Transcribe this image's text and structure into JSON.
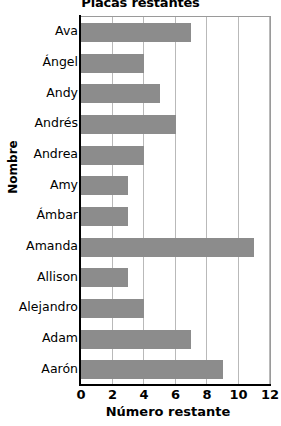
{
  "chart_data": {
    "type": "bar",
    "orientation": "horizontal",
    "title": "Placas restantes",
    "xlabel": "Número restante",
    "ylabel": "Nombre",
    "categories": [
      "Ava",
      "Ángel",
      "Andy",
      "Andrés",
      "Andrea",
      "Amy",
      "Ámbar",
      "Amanda",
      "Allison",
      "Alejandro",
      "Adam",
      "Aarón"
    ],
    "values": [
      7,
      4,
      5,
      6,
      4,
      3,
      3,
      11,
      3,
      4,
      7,
      9
    ],
    "xlim": [
      0,
      12
    ],
    "xticks": [
      0,
      2,
      4,
      6,
      8,
      10,
      12
    ],
    "xtick_labels": [
      "0",
      "2",
      "4",
      "6",
      "8",
      "10",
      "12"
    ],
    "grid": "vertical",
    "legend": null,
    "bar_color": "#8c8c8c",
    "grid_color": "#b9b9b9",
    "axis_color": "#000000",
    "background": "#ffffff"
  }
}
